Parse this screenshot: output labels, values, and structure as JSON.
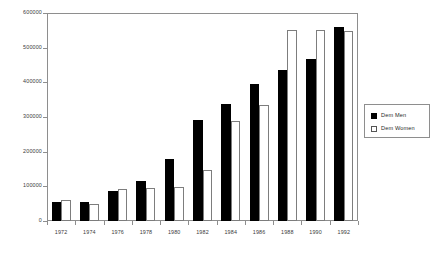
{
  "chart_data": {
    "type": "bar",
    "title": "",
    "subtitle": "",
    "xlabel": "",
    "ylabel": "",
    "grid": false,
    "legend_position": "right",
    "categories": [
      "1972",
      "1974",
      "1976",
      "1978",
      "1980",
      "1982",
      "1984",
      "1986",
      "1988",
      "1990",
      "1992"
    ],
    "ylim": [
      0,
      600000
    ],
    "ytick_labels": [
      "600000",
      "500000",
      "400000",
      "300000",
      "200000",
      "100000",
      "0"
    ],
    "ytick_values": [
      600000,
      500000,
      400000,
      300000,
      200000,
      100000,
      0
    ],
    "series": [
      {
        "name": "Dem Men",
        "color": "#000000",
        "values": [
          55000,
          55000,
          88000,
          115000,
          180000,
          292000,
          338000,
          395000,
          437000,
          468000,
          560000
        ]
      },
      {
        "name": "Dem Women",
        "color": "#ffffff",
        "values": [
          60000,
          50000,
          91000,
          95000,
          98000,
          148000,
          288000,
          335000,
          552000,
          552000,
          548000
        ]
      }
    ]
  },
  "legend": {
    "items": [
      {
        "label": "Dem Men",
        "swatch": "filled-square-icon"
      },
      {
        "label": "Dem Women",
        "swatch": "outlined-square-icon"
      }
    ]
  }
}
